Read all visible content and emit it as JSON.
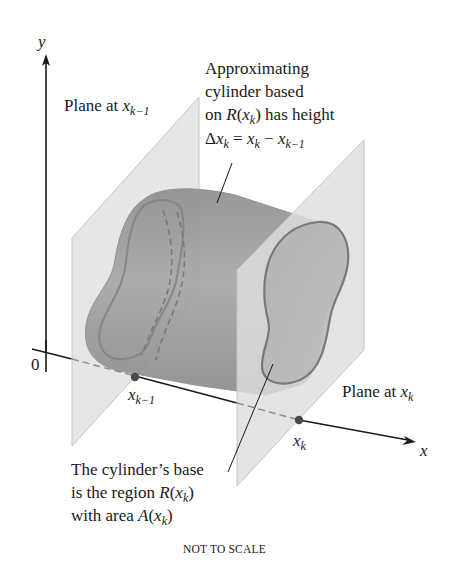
{
  "diagram": {
    "axes": {
      "y_label": "y",
      "x_label": "x",
      "origin_label": "0"
    },
    "planes": [
      {
        "id": "plane-left",
        "label_prefix": "Plane at ",
        "var": "x",
        "sub": "k−1"
      },
      {
        "id": "plane-right",
        "label_prefix": "Plane at ",
        "var": "x",
        "sub": "k"
      }
    ],
    "points": [
      {
        "id": "x-k-minus-1",
        "var": "x",
        "sub": "k−1"
      },
      {
        "id": "x-k",
        "var": "x",
        "sub": "k"
      }
    ],
    "annotation_top": {
      "line1": "Approximating",
      "line2": "cylinder based",
      "line3_prefix": "on ",
      "line3_R": "R",
      "line3_arg_var": "x",
      "line3_arg_sub": "k",
      "line3_suffix": " has height",
      "line4_delta": "Δ",
      "line4_var": "x",
      "line4_sub": "k",
      "line4_eq": " = ",
      "line4_rhs1_var": "x",
      "line4_rhs1_sub": "k",
      "line4_minus": " − ",
      "line4_rhs2_var": "x",
      "line4_rhs2_sub": "k−1"
    },
    "annotation_bottom": {
      "line1": "The cylinder’s base",
      "line2_prefix": "is the region ",
      "line2_R": "R",
      "line2_var": "x",
      "line2_sub": "k",
      "line3_prefix": "with area ",
      "line3_A": "A",
      "line3_var": "x",
      "line3_sub": "k"
    },
    "footer": "NOT TO SCALE",
    "colors": {
      "plane_fill": "#d9d9d9",
      "plane_edge": "#bdbdbd",
      "cylinder_fill": "#9a9a9a",
      "cylinder_edge": "#7d7d7d",
      "axis": "#1a1a1a",
      "point": "#4a4a4a"
    }
  }
}
